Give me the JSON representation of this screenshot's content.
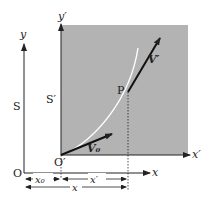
{
  "diagram": {
    "frame_S": {
      "label": "S",
      "origin": "O",
      "x_axis": "x",
      "y_axis": "y"
    },
    "frame_S_prime": {
      "label": "S′",
      "origin": "O′",
      "x_axis": "x′",
      "y_axis": "y′",
      "fill_color": "#b3b3b3"
    },
    "point": {
      "label": "P"
    },
    "vectors": {
      "v0": "V₀",
      "v_prime": "V′"
    },
    "dimensions": {
      "x0": "x₀",
      "x_prime": "x′",
      "x": "x"
    },
    "colors": {
      "axis": "#222222",
      "frame_fill": "#b3b3b3",
      "trajectory": "#ffffff"
    }
  }
}
